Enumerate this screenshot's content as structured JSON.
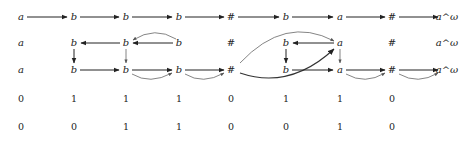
{
  "diagram": {
    "columns_x": [
      21,
      74,
      126,
      179,
      231,
      286,
      340,
      392,
      447
    ],
    "rows": [
      {
        "id": "row1",
        "y": 17,
        "cells": [
          "a",
          "b",
          "b",
          "b",
          "#",
          "b",
          "a",
          "#",
          "a^ω"
        ]
      },
      {
        "id": "row2",
        "y": 43,
        "cells": [
          "a",
          "b",
          "b",
          "b",
          "#",
          "b",
          "a",
          "#",
          "a^ω"
        ]
      },
      {
        "id": "row3",
        "y": 71,
        "cells": [
          "a",
          "b",
          "b",
          "b",
          "#",
          "b",
          "a",
          "#",
          "a^ω"
        ]
      },
      {
        "id": "row4",
        "y": 99,
        "cells": [
          "0",
          "1",
          "1",
          "1",
          "0",
          "1",
          "1",
          "0",
          ""
        ]
      },
      {
        "id": "row5",
        "y": 127,
        "cells": [
          "0",
          "0",
          "1",
          "1",
          "0",
          "0",
          "1",
          "0",
          ""
        ]
      }
    ],
    "edges": [
      {
        "from": "r1c0",
        "to": "r1c1",
        "type": "straight"
      },
      {
        "from": "r1c1",
        "to": "r1c2",
        "type": "straight"
      },
      {
        "from": "r1c2",
        "to": "r1c3",
        "type": "straight"
      },
      {
        "from": "r1c3",
        "to": "r1c4",
        "type": "straight"
      },
      {
        "from": "r1c4",
        "to": "r1c5",
        "type": "straight"
      },
      {
        "from": "r1c5",
        "to": "r1c6",
        "type": "straight"
      },
      {
        "from": "r1c6",
        "to": "r1c7",
        "type": "straight"
      },
      {
        "from": "r1c7",
        "to": "r1c8",
        "type": "straight"
      },
      {
        "from": "r2c2",
        "to": "r2c1",
        "type": "straight"
      },
      {
        "from": "r2c3",
        "to": "r2c2",
        "type": "straight"
      },
      {
        "from": "r2c3",
        "to": "r2c2",
        "type": "curve-above"
      },
      {
        "from": "r2c6",
        "to": "r2c5",
        "type": "straight"
      },
      {
        "from": "r3c4",
        "to": "r2c6",
        "type": "curve-light"
      },
      {
        "from": "r2c1",
        "to": "r3c1",
        "type": "down"
      },
      {
        "from": "r2c2",
        "to": "r3c2",
        "type": "down-light"
      },
      {
        "from": "r2c5",
        "to": "r3c5",
        "type": "down"
      },
      {
        "from": "r2c6",
        "to": "r3c6",
        "type": "down-light"
      },
      {
        "from": "r3c1",
        "to": "r3c2",
        "type": "straight"
      },
      {
        "from": "r3c2",
        "to": "r3c3",
        "type": "straight"
      },
      {
        "from": "r3c2",
        "to": "r3c3",
        "type": "curve-below"
      },
      {
        "from": "r3c3",
        "to": "r3c4",
        "type": "straight"
      },
      {
        "from": "r3c3",
        "to": "r3c4",
        "type": "curve-below"
      },
      {
        "from": "r3c4",
        "to": "r2c6",
        "type": "curve-bold-below"
      },
      {
        "from": "r3c5",
        "to": "r3c6",
        "type": "straight"
      },
      {
        "from": "r3c6",
        "to": "r3c7",
        "type": "straight"
      },
      {
        "from": "r3c6",
        "to": "r3c7",
        "type": "curve-below"
      },
      {
        "from": "r3c7",
        "to": "r3c8",
        "type": "straight"
      },
      {
        "from": "r3c7",
        "to": "r3c8",
        "type": "curve-below"
      }
    ]
  }
}
